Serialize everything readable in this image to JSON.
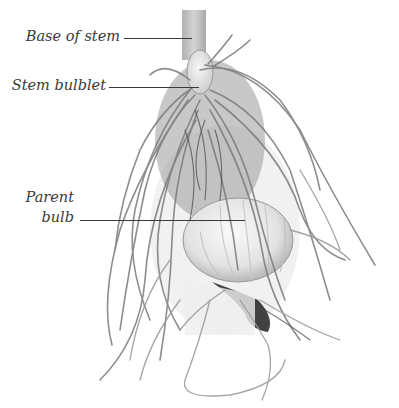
{
  "figure": {
    "colors": {
      "background": "#ffffff",
      "label_text": "#3a3a3a",
      "leader_line": "#3a3a3a",
      "root": "#8a8a8a",
      "root_dark": "#3c3c3c",
      "bulb": "#e6e6e6",
      "stem": "#c8c8c8"
    },
    "labels": [
      {
        "id": "base-of-stem",
        "text": "Base of stem"
      },
      {
        "id": "stem-bulblet",
        "text": "Stem bulblet"
      },
      {
        "id": "parent-bulb-line1",
        "text": "Parent"
      },
      {
        "id": "parent-bulb-line2",
        "text": "bulb"
      }
    ]
  }
}
